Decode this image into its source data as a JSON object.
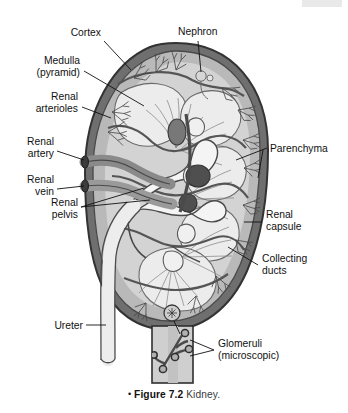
{
  "figure": {
    "caption_bullet": "•",
    "caption_number": "Figure 7.2",
    "caption_title": "Kidney."
  },
  "labels": [
    {
      "id": "cortex",
      "text": "Cortex",
      "line2": ""
    },
    {
      "id": "nephron",
      "text": "Nephron",
      "line2": ""
    },
    {
      "id": "medulla",
      "text": "Medulla",
      "line2": "(pyramid)"
    },
    {
      "id": "renal-arterioles",
      "text": "Renal",
      "line2": "arterioles"
    },
    {
      "id": "renal-artery",
      "text": "Renal",
      "line2": "artery"
    },
    {
      "id": "renal-vein",
      "text": "Renal",
      "line2": "vein"
    },
    {
      "id": "renal-pelvis",
      "text": "Renal",
      "line2": "pelvis"
    },
    {
      "id": "ureter",
      "text": "Ureter",
      "line2": ""
    },
    {
      "id": "parenchyma",
      "text": "Parenchyma",
      "line2": ""
    },
    {
      "id": "renal-capsule",
      "text": "Renal",
      "line2": "capsule"
    },
    {
      "id": "collecting-ducts",
      "text": "Collecting",
      "line2": "ducts"
    },
    {
      "id": "glomeruli",
      "text": "Glomeruli",
      "line2": "(microscopic)"
    }
  ],
  "colors": {
    "outline": "#3b3b3b",
    "capsule": "#6f6f6f",
    "cortex": "#b9b9b9",
    "medulla": "#d8d8d8",
    "pyramid": "#e8e8e8",
    "vessel_dark": "#5a5a5a",
    "vessel_light": "#f0f0f0",
    "pelvis": "#ededed",
    "inset_fill": "#cfcfcf",
    "header_bar": "#e9e9e9",
    "text": "#111111"
  },
  "inset": {
    "id": "glomeruli-inset",
    "description": "microscopic glomeruli detail box"
  }
}
